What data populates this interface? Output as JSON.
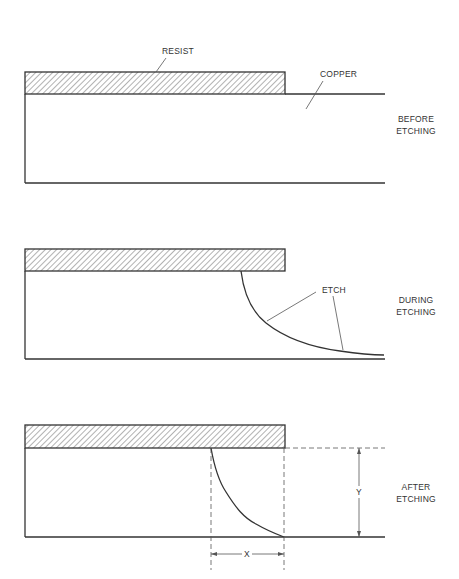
{
  "figure": {
    "type": "cross-section diagram",
    "colors": {
      "line": "#333333",
      "background": "#ffffff",
      "hatch": "#555555"
    }
  },
  "panels": [
    {
      "id": "before",
      "stage_label_line1": "BEFORE",
      "stage_label_line2": "ETCHING",
      "callouts": [
        {
          "id": "resist",
          "text": "RESIST"
        },
        {
          "id": "copper",
          "text": "COPPER"
        }
      ]
    },
    {
      "id": "during",
      "stage_label_line1": "DURING",
      "stage_label_line2": "ETCHING",
      "callouts": [
        {
          "id": "etch",
          "text": "ETCH"
        }
      ]
    },
    {
      "id": "after",
      "stage_label_line1": "AFTER",
      "stage_label_line2": "ETCHING",
      "dimensions": [
        {
          "id": "x",
          "text": "X",
          "meaning": "lateral undercut"
        },
        {
          "id": "y",
          "text": "Y",
          "meaning": "etch depth (copper thickness)"
        }
      ]
    }
  ]
}
